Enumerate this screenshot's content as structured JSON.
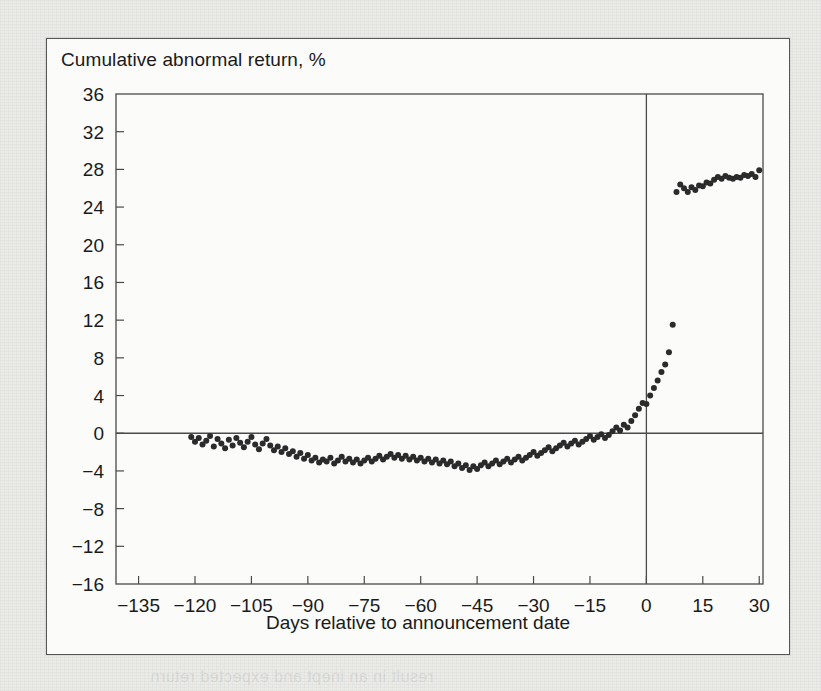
{
  "figure": {
    "title": "Cumulative abnormal return, %",
    "x_axis_title": "Days relative to announcement date"
  },
  "bleed_through": {
    "top": "Announcement date",
    "mid1": "Cumulative",
    "mid2": "abnormal",
    "mid3": "return",
    "low": "Days relative to announcement",
    "bottom": "result in an inept and expected return"
  },
  "chart_data": {
    "type": "scatter",
    "title": "Cumulative abnormal return, %",
    "xlabel": "Days relative to announcement date",
    "ylabel": "Cumulative abnormal return, %",
    "xlim": [
      -141,
      31
    ],
    "ylim": [
      -16,
      36
    ],
    "xticks": [
      "−135",
      "−120",
      "−105",
      "−90",
      "−75",
      "−60",
      "−45",
      "−30",
      "−15",
      "0",
      "15",
      "30"
    ],
    "xtick_values": [
      -135,
      -120,
      -105,
      -90,
      -75,
      -60,
      -45,
      -30,
      -15,
      0,
      15,
      30
    ],
    "yticks": [
      "36",
      "32",
      "28",
      "24",
      "20",
      "16",
      "12",
      "8",
      "4",
      "0",
      "−4",
      "−8",
      "−12",
      "−16"
    ],
    "ytick_values": [
      36,
      32,
      28,
      24,
      20,
      16,
      12,
      8,
      4,
      0,
      -4,
      -8,
      -12,
      -16
    ],
    "grid": false,
    "legend": null,
    "annotations": [
      {
        "type": "vline",
        "x": 0,
        "label": "announcement date"
      },
      {
        "type": "hline",
        "y": 0,
        "label": "zero abnormal return"
      }
    ],
    "marker": {
      "shape": "circle",
      "size": 3,
      "color": "#2b2b2b"
    },
    "x": [
      -121,
      -120,
      -119,
      -118,
      -117,
      -116,
      -115,
      -114,
      -113,
      -112,
      -111,
      -110,
      -109,
      -108,
      -107,
      -106,
      -105,
      -104,
      -103,
      -102,
      -101,
      -100,
      -99,
      -98,
      -97,
      -96,
      -95,
      -94,
      -93,
      -92,
      -91,
      -90,
      -89,
      -88,
      -87,
      -86,
      -85,
      -84,
      -83,
      -82,
      -81,
      -80,
      -79,
      -78,
      -77,
      -76,
      -75,
      -74,
      -73,
      -72,
      -71,
      -70,
      -69,
      -68,
      -67,
      -66,
      -65,
      -64,
      -63,
      -62,
      -61,
      -60,
      -59,
      -58,
      -57,
      -56,
      -55,
      -54,
      -53,
      -52,
      -51,
      -50,
      -49,
      -48,
      -47,
      -46,
      -45,
      -44,
      -43,
      -42,
      -41,
      -40,
      -39,
      -38,
      -37,
      -36,
      -35,
      -34,
      -33,
      -32,
      -31,
      -30,
      -29,
      -28,
      -27,
      -26,
      -25,
      -24,
      -23,
      -22,
      -21,
      -20,
      -19,
      -18,
      -17,
      -16,
      -15,
      -14,
      -13,
      -12,
      -11,
      -10,
      -9,
      -8,
      -7,
      -6,
      -5,
      -4,
      -3,
      -2,
      -1,
      0,
      1,
      2,
      3,
      4,
      5,
      6,
      7,
      8,
      9,
      10,
      11,
      12,
      13,
      14,
      15,
      16,
      17,
      18,
      19,
      20,
      21,
      22,
      23,
      24,
      25,
      26,
      27,
      28,
      29,
      30
    ],
    "y": [
      -0.4,
      -0.9,
      -0.5,
      -1.2,
      -0.8,
      -0.3,
      -1.4,
      -0.6,
      -1.1,
      -1.6,
      -0.7,
      -1.3,
      -0.5,
      -1.0,
      -1.5,
      -0.9,
      -0.4,
      -1.2,
      -1.7,
      -1.1,
      -0.6,
      -1.3,
      -1.8,
      -1.4,
      -2.0,
      -1.6,
      -2.2,
      -1.9,
      -2.5,
      -2.1,
      -2.7,
      -2.3,
      -2.9,
      -2.6,
      -3.1,
      -2.8,
      -3.0,
      -2.6,
      -3.2,
      -2.9,
      -2.5,
      -3.0,
      -2.7,
      -3.1,
      -2.8,
      -3.2,
      -2.9,
      -2.6,
      -3.0,
      -2.7,
      -2.4,
      -2.8,
      -2.5,
      -2.2,
      -2.6,
      -2.3,
      -2.7,
      -2.4,
      -2.8,
      -2.5,
      -2.9,
      -2.6,
      -3.0,
      -2.7,
      -3.1,
      -2.8,
      -3.2,
      -2.9,
      -3.3,
      -3.0,
      -3.5,
      -3.2,
      -3.7,
      -3.4,
      -3.9,
      -3.5,
      -3.8,
      -3.4,
      -3.1,
      -3.5,
      -3.2,
      -2.9,
      -3.3,
      -3.0,
      -2.7,
      -3.1,
      -2.8,
      -2.5,
      -2.9,
      -2.6,
      -2.3,
      -2.0,
      -2.4,
      -2.1,
      -1.8,
      -1.5,
      -1.9,
      -1.6,
      -1.3,
      -1.0,
      -1.4,
      -1.1,
      -0.8,
      -1.2,
      -0.9,
      -0.6,
      -0.3,
      -0.7,
      -0.4,
      -0.1,
      -0.5,
      -0.2,
      0.2,
      0.6,
      0.3,
      0.9,
      0.6,
      1.3,
      1.9,
      2.6,
      3.2,
      3.1,
      4.0,
      4.8,
      5.6,
      6.5,
      7.3,
      8.6,
      11.5,
      25.6,
      26.4,
      26.0,
      25.6,
      26.1,
      25.8,
      26.3,
      26.2,
      26.6,
      26.5,
      26.9,
      27.2,
      27.0,
      27.3,
      27.1,
      27.0,
      27.2,
      27.1,
      27.4,
      27.3,
      27.5,
      27.2,
      27.9,
      28.2,
      27.6,
      27.4,
      26.9,
      26.6,
      26.9,
      26.7,
      27.1,
      27.4,
      27.0
    ]
  }
}
